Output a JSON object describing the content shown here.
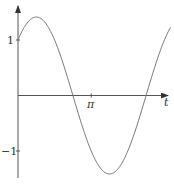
{
  "chart_data": {
    "type": "line",
    "title": "",
    "xlabel": "t",
    "ylabel": "",
    "function": "sin t + cos t",
    "x_ticks": [
      {
        "value": 3.14159,
        "label": "π"
      }
    ],
    "y_ticks": [
      {
        "value": 1,
        "label": "1"
      },
      {
        "value": -1,
        "label": "-1"
      }
    ],
    "xlim": [
      0,
      6.6
    ],
    "ylim": [
      -1.6,
      1.6
    ],
    "grid": false,
    "legend": null,
    "series": [
      {
        "name": "f(t)",
        "x": [
          0,
          0.785,
          1.571,
          2.356,
          3.142,
          3.927,
          4.712,
          5.498,
          6.283
        ],
        "values": [
          1,
          1.414,
          1,
          0,
          -1,
          -1.414,
          -1,
          0,
          1
        ]
      }
    ]
  },
  "labels": {
    "y_pos": "1",
    "y_neg": "−1",
    "x_tick": "π",
    "x_axis": "t"
  }
}
